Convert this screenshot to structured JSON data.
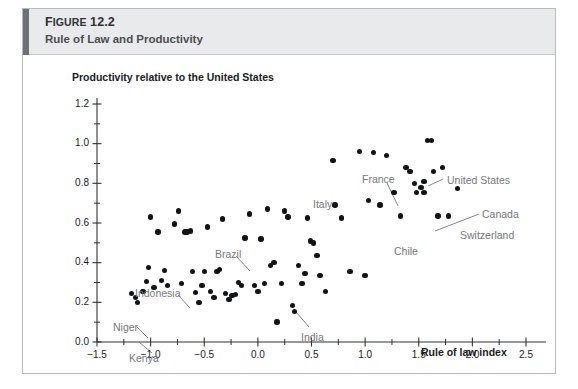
{
  "figure": {
    "number": "FIGURE 12.2",
    "number_lead": "F",
    "title": "Rule of Law and Productivity"
  },
  "chart_data": {
    "type": "scatter",
    "title": "Rule of Law and Productivity",
    "xlabel": "Rule of law index",
    "ylabel": "Productivity relative to the United States",
    "xlim": [
      -1.5,
      2.5
    ],
    "ylim": [
      0.0,
      1.2
    ],
    "xticks": [
      "-1.5",
      "-1.0",
      "-0.5",
      "0.0",
      "0.5",
      "1.0",
      "1.5",
      "2.0",
      "2.5"
    ],
    "xtick_values": [
      -1.5,
      -1.0,
      -0.5,
      0.0,
      0.5,
      1.0,
      1.5,
      2.0,
      2.5
    ],
    "yticks": [
      "0.0",
      "0.2",
      "0.4",
      "0.6",
      "0.8",
      "1.0",
      "1.2"
    ],
    "ytick_values": [
      0.0,
      0.2,
      0.4,
      0.6,
      0.8,
      1.0,
      1.2
    ],
    "minor_tick_step_x": 0.25,
    "minor_tick_step_y": 0.1,
    "grid": false,
    "legend": false,
    "marker_color": "#111315",
    "annotation_color": "#76797c",
    "points": [
      {
        "x": -1.18,
        "y": 0.245
      },
      {
        "x": -1.14,
        "y": 0.225
      },
      {
        "x": -1.12,
        "y": 0.2,
        "label": "Kenya"
      },
      {
        "x": -1.07,
        "y": 0.255,
        "label": "Niger"
      },
      {
        "x": -1.04,
        "y": 0.305
      },
      {
        "x": -1.02,
        "y": 0.375
      },
      {
        "x": -1.0,
        "y": 0.63
      },
      {
        "x": -0.97,
        "y": 0.275
      },
      {
        "x": -0.93,
        "y": 0.555
      },
      {
        "x": -0.9,
        "y": 0.31
      },
      {
        "x": -0.87,
        "y": 0.36,
        "label": "Indonesia"
      },
      {
        "x": -0.84,
        "y": 0.285
      },
      {
        "x": -0.78,
        "y": 0.595
      },
      {
        "x": -0.74,
        "y": 0.66
      },
      {
        "x": -0.71,
        "y": 0.295
      },
      {
        "x": -0.68,
        "y": 0.555
      },
      {
        "x": -0.66,
        "y": 0.555
      },
      {
        "x": -0.63,
        "y": 0.56
      },
      {
        "x": -0.61,
        "y": 0.355
      },
      {
        "x": -0.58,
        "y": 0.25
      },
      {
        "x": -0.55,
        "y": 0.2
      },
      {
        "x": -0.52,
        "y": 0.285
      },
      {
        "x": -0.5,
        "y": 0.355
      },
      {
        "x": -0.47,
        "y": 0.58
      },
      {
        "x": -0.44,
        "y": 0.255
      },
      {
        "x": -0.41,
        "y": 0.225
      },
      {
        "x": -0.38,
        "y": 0.355
      },
      {
        "x": -0.36,
        "y": 0.365
      },
      {
        "x": -0.33,
        "y": 0.62
      },
      {
        "x": -0.3,
        "y": 0.245
      },
      {
        "x": -0.27,
        "y": 0.215
      },
      {
        "x": -0.24,
        "y": 0.235
      },
      {
        "x": -0.21,
        "y": 0.24
      },
      {
        "x": -0.18,
        "y": 0.3
      },
      {
        "x": -0.15,
        "y": 0.285
      },
      {
        "x": -0.12,
        "y": 0.525,
        "label": "Brazil"
      },
      {
        "x": -0.08,
        "y": 0.645
      },
      {
        "x": -0.03,
        "y": 0.285
      },
      {
        "x": 0.0,
        "y": 0.255
      },
      {
        "x": 0.03,
        "y": 0.52
      },
      {
        "x": 0.06,
        "y": 0.295
      },
      {
        "x": 0.09,
        "y": 0.67
      },
      {
        "x": 0.12,
        "y": 0.385
      },
      {
        "x": 0.15,
        "y": 0.4
      },
      {
        "x": 0.18,
        "y": 0.1
      },
      {
        "x": 0.22,
        "y": 0.295
      },
      {
        "x": 0.25,
        "y": 0.66
      },
      {
        "x": 0.28,
        "y": 0.63
      },
      {
        "x": 0.32,
        "y": 0.185
      },
      {
        "x": 0.34,
        "y": 0.155
      },
      {
        "x": 0.38,
        "y": 0.385
      },
      {
        "x": 0.41,
        "y": 0.295
      },
      {
        "x": 0.44,
        "y": 0.345
      },
      {
        "x": 0.46,
        "y": 0.625
      },
      {
        "x": 0.49,
        "y": 0.51
      },
      {
        "x": 0.52,
        "y": 0.5
      },
      {
        "x": 0.55,
        "y": 0.435
      },
      {
        "x": 0.58,
        "y": 0.335
      },
      {
        "x": 0.63,
        "y": 0.255
      },
      {
        "x": 0.7,
        "y": 0.915,
        "label": "Italy"
      },
      {
        "x": 0.72,
        "y": 0.69
      },
      {
        "x": 0.78,
        "y": 0.625
      },
      {
        "x": 0.86,
        "y": 0.355
      },
      {
        "x": 0.95,
        "y": 0.96
      },
      {
        "x": 1.0,
        "y": 0.335
      },
      {
        "x": 1.03,
        "y": 0.715
      },
      {
        "x": 1.08,
        "y": 0.955
      },
      {
        "x": 1.14,
        "y": 0.69,
        "label": "Chile"
      },
      {
        "x": 1.2,
        "y": 0.94
      },
      {
        "x": 1.27,
        "y": 0.755
      },
      {
        "x": 1.33,
        "y": 0.635
      },
      {
        "x": 1.38,
        "y": 0.88
      },
      {
        "x": 1.42,
        "y": 0.86
      },
      {
        "x": 1.46,
        "y": 0.8
      },
      {
        "x": 1.48,
        "y": 0.755
      },
      {
        "x": 1.52,
        "y": 0.78
      },
      {
        "x": 1.55,
        "y": 0.755
      },
      {
        "x": 1.58,
        "y": 1.015
      },
      {
        "x": 1.62,
        "y": 1.015,
        "label": "United States"
      },
      {
        "x": 1.64,
        "y": 0.86
      },
      {
        "x": 1.68,
        "y": 0.635
      },
      {
        "x": 1.72,
        "y": 0.88
      },
      {
        "x": 1.78,
        "y": 0.635
      },
      {
        "x": 1.86,
        "y": 0.775,
        "label": "Switzerland"
      },
      {
        "x": 1.55,
        "y": 0.81,
        "label": "Canada"
      }
    ],
    "annotations": [
      {
        "text": "Kenya",
        "text_x": 106,
        "text_y": 297,
        "leader": [
          [
            129,
            298
          ],
          [
            116,
            287
          ]
        ]
      },
      {
        "text": "Niger",
        "text_x": 90,
        "text_y": 266,
        "leader": [
          [
            114,
            272
          ],
          [
            125,
            283
          ]
        ]
      },
      {
        "text": "Indonesia",
        "text_x": 112,
        "text_y": 232,
        "leader": [
          [
            155,
            240
          ],
          [
            167,
            253
          ]
        ]
      },
      {
        "text": "Brazil",
        "text_x": 192,
        "text_y": 193,
        "leader": [
          [
            213,
            201
          ],
          [
            227,
            216
          ]
        ]
      },
      {
        "text": "India",
        "text_x": 278,
        "text_y": 276,
        "leader": [
          [
            286,
            272
          ],
          [
            273,
            257
          ]
        ]
      },
      {
        "text": "Italy",
        "text_x": 290,
        "text_y": 143,
        "leader": []
      },
      {
        "text": "France",
        "text_x": 339,
        "text_y": 118,
        "leader": [
          [
            364,
            128
          ],
          [
            375,
            151
          ]
        ]
      },
      {
        "text": "Chile",
        "text_x": 371,
        "text_y": 190,
        "leader": []
      },
      {
        "text": "United States",
        "text_x": 424,
        "text_y": 119,
        "leader": [
          [
            420,
            124
          ],
          [
            405,
            131
          ]
        ]
      },
      {
        "text": "Canada",
        "text_x": 459,
        "text_y": 153,
        "leader": [
          [
            456,
            159
          ],
          [
            412,
            176
          ]
        ]
      },
      {
        "text": "Switzerland",
        "text_x": 437,
        "text_y": 174,
        "leader": []
      }
    ]
  }
}
